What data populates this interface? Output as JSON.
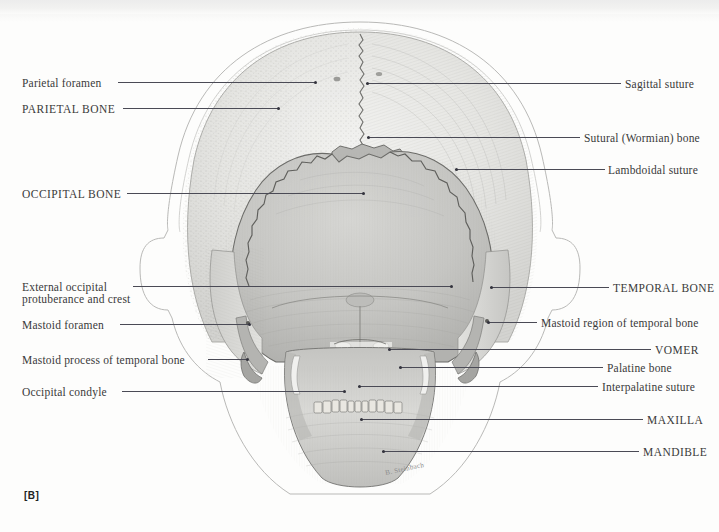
{
  "figure": {
    "id": "[B]",
    "view": "posterior view of the human skull",
    "signature": "B. Steinbach"
  },
  "colors": {
    "page_background": "#fdfdfc",
    "leader_line": "#4a4a55",
    "label_text": "#3a3a3a",
    "parietal_fill": "#e7e7e4",
    "occipital_fill": "#c9c9c6",
    "temporal_fill": "#d8d8d5",
    "wormian_fill": "#b9b9b7",
    "mandible_fill": "#d2d2cf",
    "outline": "#9a9a98"
  },
  "labels_left": [
    {
      "id": "parietal-foramen",
      "text": "Parietal foramen",
      "caps": false,
      "x": 22,
      "y": 77,
      "line_x1": 118,
      "line_x2": 316,
      "line_y": 82,
      "dot_x": 314,
      "dot_y": 81
    },
    {
      "id": "parietal-bone",
      "text": "PARIETAL BONE",
      "caps": true,
      "x": 22,
      "y": 103,
      "line_x1": 123,
      "line_x2": 279,
      "line_y": 108,
      "dot_x": 277,
      "dot_y": 107
    },
    {
      "id": "occipital-bone",
      "text": "OCCIPITAL BONE",
      "caps": true,
      "x": 22,
      "y": 188,
      "line_x1": 127,
      "line_x2": 364,
      "line_y": 193,
      "dot_x": 362,
      "dot_y": 192
    },
    {
      "id": "external-occipital-protuberance",
      "text": "External occipital",
      "caps": false,
      "x": 22,
      "y": 281,
      "line_x1": 133,
      "line_x2": 452,
      "line_y": 286,
      "dot_x": 450,
      "dot_y": 285
    },
    {
      "id": "external-occipital-protuberance-line2",
      "text": "protuberance and crest",
      "caps": false,
      "x": 22,
      "y": 293
    },
    {
      "id": "mastoid-foramen",
      "text": "Mastoid foramen",
      "caps": false,
      "x": 22,
      "y": 319,
      "line_x1": 120,
      "line_x2": 250,
      "line_y": 324,
      "dot_x": 248,
      "dot_y": 323
    },
    {
      "id": "mastoid-process",
      "text": "Mastoid process of temporal bone",
      "caps": false,
      "x": 22,
      "y": 354,
      "line_x1": 208,
      "line_x2": 248,
      "line_y": 359,
      "dot_x": 246,
      "dot_y": 358
    },
    {
      "id": "occipital-condyle",
      "text": "Occipital condyle",
      "caps": false,
      "x": 22,
      "y": 386,
      "line_x1": 122,
      "line_x2": 345,
      "line_y": 391,
      "dot_x": 343,
      "dot_y": 390
    }
  ],
  "labels_right": [
    {
      "id": "sagittal-suture",
      "text": "Sagittal suture",
      "caps": false,
      "x": 625,
      "y": 78,
      "line_x1": 366,
      "line_x2": 621,
      "line_y": 83,
      "dot_x": 366,
      "dot_y": 82
    },
    {
      "id": "sutural-wormian-bone",
      "text": "Sutural (Wormian) bone",
      "caps": false,
      "x": 584,
      "y": 132,
      "line_x1": 367,
      "line_x2": 580,
      "line_y": 137,
      "dot_x": 367,
      "dot_y": 136
    },
    {
      "id": "lambdoidal-suture",
      "text": "Lambdoidal suture",
      "caps": false,
      "x": 608,
      "y": 164,
      "line_x1": 455,
      "line_x2": 605,
      "line_y": 169,
      "dot_x": 455,
      "dot_y": 168
    },
    {
      "id": "temporal-bone",
      "text": "TEMPORAL BONE",
      "caps": true,
      "x": 613,
      "y": 282,
      "line_x1": 490,
      "line_x2": 609,
      "line_y": 287,
      "dot_x": 490,
      "dot_y": 286
    },
    {
      "id": "mastoid-region",
      "text": "Mastoid region of temporal bone",
      "caps": false,
      "x": 541,
      "y": 317,
      "line_x1": 487,
      "line_x2": 537,
      "line_y": 322,
      "dot_x": 487,
      "dot_y": 321
    },
    {
      "id": "vomer",
      "text": "VOMER",
      "caps": true,
      "x": 655,
      "y": 344,
      "line_x1": 388,
      "line_x2": 651,
      "line_y": 349,
      "dot_x": 388,
      "dot_y": 348
    },
    {
      "id": "palatine-bone",
      "text": "Palatine bone",
      "caps": false,
      "x": 607,
      "y": 362,
      "line_x1": 399,
      "line_x2": 603,
      "line_y": 367,
      "dot_x": 399,
      "dot_y": 366
    },
    {
      "id": "interpalatine-suture",
      "text": "Interpalatine suture",
      "caps": false,
      "x": 602,
      "y": 381,
      "line_x1": 358,
      "line_x2": 598,
      "line_y": 386,
      "dot_x": 358,
      "dot_y": 385
    },
    {
      "id": "maxilla",
      "text": "MAXILLA",
      "caps": true,
      "x": 647,
      "y": 414,
      "line_x1": 360,
      "line_x2": 643,
      "line_y": 419,
      "dot_x": 360,
      "dot_y": 418
    },
    {
      "id": "mandible",
      "text": "MANDIBLE",
      "caps": true,
      "x": 643,
      "y": 446,
      "line_x1": 382,
      "line_x2": 639,
      "line_y": 451,
      "dot_x": 382,
      "dot_y": 450
    }
  ]
}
